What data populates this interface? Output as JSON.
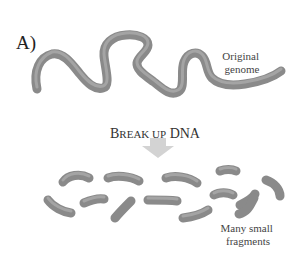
{
  "figure": {
    "panel_label": "A)",
    "genome_label": [
      "Original",
      "genome"
    ],
    "step_label": {
      "first_letter": "B",
      "rest_smallcaps": "REAK UP",
      "tail": " DNA",
      "full": "Break up DNA"
    },
    "fragments_label": [
      "Many small",
      "fragments"
    ],
    "fragment_count": 14,
    "colors": {
      "strand": "#8a8a8a",
      "strand_highlight": "#a4a4a4",
      "arrow": "#d3d3d3",
      "text": "#333333"
    }
  }
}
